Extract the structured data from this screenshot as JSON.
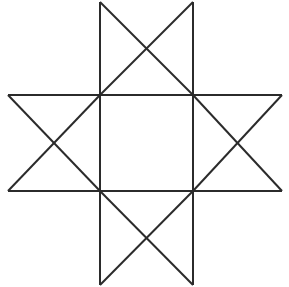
{
  "canvas": {
    "width": 289,
    "height": 287,
    "background_color": "#ffffff",
    "title": "Eight-pointed star figure"
  },
  "figure": {
    "name": "eight-pointed-star",
    "stroke_color": "#2b2b2b",
    "stroke_width": 2,
    "fill": "none"
  },
  "chart_data": {
    "type": "line",
    "title": "Eight-pointed star formed by two overlapping squares",
    "xlabel": "",
    "ylabel": "",
    "xlim": [
      0,
      289
    ],
    "ylim": [
      0,
      287
    ],
    "grid": false,
    "legend": "none",
    "shapes": [
      {
        "name": "upright-square",
        "kind": "polygon",
        "closed": true,
        "points": [
          [
            100,
            2
          ],
          [
            193,
            2
          ],
          [
            193,
            285
          ],
          [
            100,
            285
          ]
        ],
        "note": "tall vertical band: left and right vertical edges at x=100 and x=193 spanning full height"
      },
      {
        "name": "horizontal-band",
        "kind": "polygon",
        "closed": true,
        "points": [
          [
            8,
            95
          ],
          [
            282,
            95
          ],
          [
            282,
            191
          ],
          [
            8,
            191
          ]
        ],
        "note": "wide horizontal band: top and bottom edges at y=95 and y=191 spanning full width"
      },
      {
        "name": "diagonal-square-a",
        "kind": "polyline",
        "closed": false,
        "points": [
          [
            100,
            2
          ],
          [
            193,
            95
          ],
          [
            282,
            191
          ],
          [
            100,
            191
          ]
        ],
        "note": "falling diagonals"
      }
    ],
    "lines": [
      {
        "name": "vertical-left",
        "x1": 100,
        "y1": 2,
        "x2": 100,
        "y2": 285
      },
      {
        "name": "vertical-right",
        "x1": 193,
        "y1": 2,
        "x2": 193,
        "y2": 285
      },
      {
        "name": "horizontal-top",
        "x1": 8,
        "y1": 95,
        "x2": 282,
        "y2": 95
      },
      {
        "name": "horizontal-bottom",
        "x1": 8,
        "y1": 191,
        "x2": 282,
        "y2": 191
      },
      {
        "name": "diag-top-left-down-right",
        "x1": 100,
        "y1": 2,
        "x2": 193,
        "y2": 95
      },
      {
        "name": "diag-top-right-down-left",
        "x1": 193,
        "y1": 2,
        "x2": 100,
        "y2": 95
      },
      {
        "name": "diag-left-up-right",
        "x1": 8,
        "y1": 95,
        "x2": 100,
        "y2": 191
      },
      {
        "name": "diag-left-down-right",
        "x1": 8,
        "y1": 191,
        "x2": 100,
        "y2": 95
      },
      {
        "name": "diag-right-up-left",
        "x1": 282,
        "y1": 95,
        "x2": 193,
        "y2": 191
      },
      {
        "name": "diag-right-down-left",
        "x1": 282,
        "y1": 191,
        "x2": 193,
        "y2": 95
      },
      {
        "name": "diag-bottom-left-up-right",
        "x1": 100,
        "y1": 285,
        "x2": 193,
        "y2": 191
      },
      {
        "name": "diag-bottom-right-up-left",
        "x1": 193,
        "y1": 285,
        "x2": 100,
        "y2": 191
      }
    ],
    "vertices": {
      "star_tips": [
        {
          "name": "tip-top-left",
          "x": 100,
          "y": 2
        },
        {
          "name": "tip-top-right",
          "x": 193,
          "y": 2
        },
        {
          "name": "tip-left-top",
          "x": 8,
          "y": 95
        },
        {
          "name": "tip-right-top",
          "x": 282,
          "y": 95
        },
        {
          "name": "tip-left-bottom",
          "x": 8,
          "y": 191
        },
        {
          "name": "tip-right-bottom",
          "x": 282,
          "y": 191
        },
        {
          "name": "tip-bottom-left",
          "x": 100,
          "y": 285
        },
        {
          "name": "tip-bottom-right",
          "x": 193,
          "y": 285
        }
      ],
      "inner_square": [
        {
          "name": "inner-top-left",
          "x": 100,
          "y": 95
        },
        {
          "name": "inner-top-right",
          "x": 193,
          "y": 95
        },
        {
          "name": "inner-bottom-right",
          "x": 193,
          "y": 191
        },
        {
          "name": "inner-bottom-left",
          "x": 100,
          "y": 191
        }
      ],
      "crossings": [
        {
          "name": "crossing-top",
          "x": 147,
          "y": 48
        },
        {
          "name": "crossing-left",
          "x": 55,
          "y": 143
        },
        {
          "name": "crossing-right",
          "x": 238,
          "y": 143
        },
        {
          "name": "crossing-bottom",
          "x": 147,
          "y": 238
        }
      ]
    },
    "counts": {
      "points": 8,
      "line_segments": 12,
      "inner_square_side": 93
    }
  }
}
